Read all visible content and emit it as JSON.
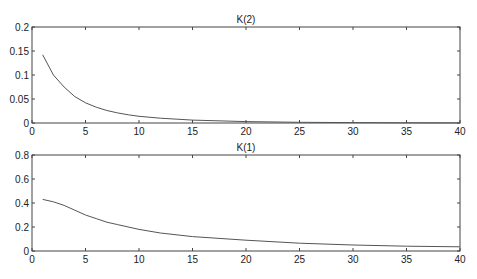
{
  "chart_data": [
    {
      "type": "line",
      "title": "K(2)",
      "xlabel": "",
      "ylabel": "",
      "xlim": [
        0,
        40
      ],
      "ylim": [
        0,
        0.2
      ],
      "xticks": [
        "0",
        "5",
        "10",
        "15",
        "20",
        "25",
        "30",
        "35",
        "40"
      ],
      "yticks": [
        "0",
        "0.05",
        "0.1",
        "0.15",
        "0.2"
      ],
      "grid": false,
      "series": [
        {
          "name": "K(2)",
          "x": [
            1,
            2,
            3,
            4,
            5,
            6,
            7,
            8,
            9,
            10,
            12,
            15,
            20,
            25,
            30,
            35,
            40
          ],
          "values": [
            0.142,
            0.1,
            0.075,
            0.055,
            0.042,
            0.033,
            0.026,
            0.021,
            0.017,
            0.014,
            0.01,
            0.006,
            0.003,
            0.0015,
            0.0008,
            0.0005,
            0.0003
          ]
        }
      ]
    },
    {
      "type": "line",
      "title": "K(1)",
      "xlabel": "",
      "ylabel": "",
      "xlim": [
        0,
        40
      ],
      "ylim": [
        0,
        0.8
      ],
      "xticks": [
        "0",
        "5",
        "10",
        "15",
        "20",
        "25",
        "30",
        "35",
        "40"
      ],
      "yticks": [
        "0",
        "0.2",
        "0.4",
        "0.6",
        "0.8"
      ],
      "grid": false,
      "series": [
        {
          "name": "K(1)",
          "x": [
            1,
            2,
            3,
            4,
            5,
            6,
            7,
            8,
            10,
            12,
            15,
            20,
            25,
            30,
            35,
            40
          ],
          "values": [
            0.43,
            0.41,
            0.38,
            0.34,
            0.3,
            0.27,
            0.24,
            0.22,
            0.18,
            0.15,
            0.12,
            0.09,
            0.065,
            0.05,
            0.04,
            0.035
          ]
        }
      ]
    }
  ],
  "colors": {
    "line": "#555555",
    "axes": "#444444"
  }
}
